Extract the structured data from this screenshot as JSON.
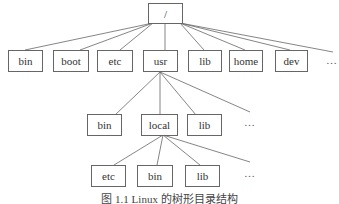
{
  "diagram": {
    "root": {
      "label": "/"
    },
    "level1": [
      {
        "label": "bin"
      },
      {
        "label": "boot"
      },
      {
        "label": "etc"
      },
      {
        "label": "usr"
      },
      {
        "label": "lib"
      },
      {
        "label": "home"
      },
      {
        "label": "dev"
      }
    ],
    "level1_more": "…",
    "level2": [
      {
        "label": "bin"
      },
      {
        "label": "local"
      },
      {
        "label": "lib"
      }
    ],
    "level2_more": "…",
    "level3": [
      {
        "label": "etc"
      },
      {
        "label": "bin"
      },
      {
        "label": "lib"
      }
    ],
    "level3_more": "…",
    "caption": "图 1.1  Linux 的树形目录结构"
  }
}
